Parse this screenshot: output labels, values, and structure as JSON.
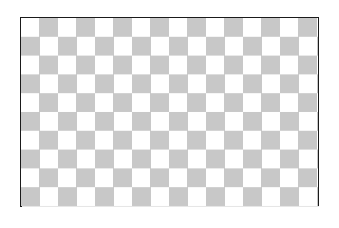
{
  "image": {
    "description": "Checkerboard transparency pattern inside a bordered rectangle",
    "pattern": {
      "type": "checkerboard",
      "colors": {
        "dark": "#c8c8c8",
        "light": "#ffffff"
      },
      "top_left_square": "dark",
      "columns": 16,
      "rows": 10
    },
    "border_color": "#1a1a1a"
  }
}
